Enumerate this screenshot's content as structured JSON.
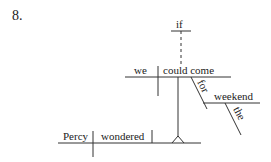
{
  "exercise_number": "8.",
  "diagram": {
    "type": "sentence-diagram",
    "main_clause": {
      "subject": "Percy",
      "verb": "wondered"
    },
    "subordinate_clause": {
      "conjunction": "if",
      "subject": "we",
      "verb": "could come",
      "preposition": "for",
      "object_of_preposition": "weekend",
      "article": "the"
    }
  }
}
